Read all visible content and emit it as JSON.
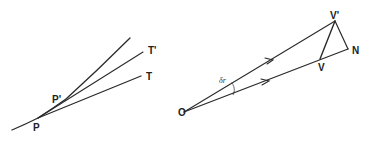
{
  "diagram": {
    "left": {
      "title": "Tangent lines to a curve",
      "labels": {
        "p": "P",
        "p_prime": "P'",
        "t": "T",
        "t_prime": "T'"
      },
      "points": {
        "curve_start": [
          12,
          130
        ],
        "P": [
          38,
          118
        ],
        "P_prime": [
          66,
          99
        ],
        "curve_end": [
          130,
          38
        ],
        "T": [
          141,
          76
        ],
        "T_prime": [
          143,
          52
        ]
      }
    },
    "right": {
      "title": "Velocity vector difference",
      "labels": {
        "o": "O",
        "v_prime": "V'",
        "v": "V",
        "n": "N",
        "delta_r": "δr"
      },
      "points": {
        "O": [
          184,
          112
        ],
        "V_prime": [
          335,
          21
        ],
        "V": [
          320,
          59
        ],
        "N": [
          348,
          49
        ]
      }
    },
    "colors": {
      "line": "#2a2a2a",
      "background": "#ffffff"
    }
  }
}
